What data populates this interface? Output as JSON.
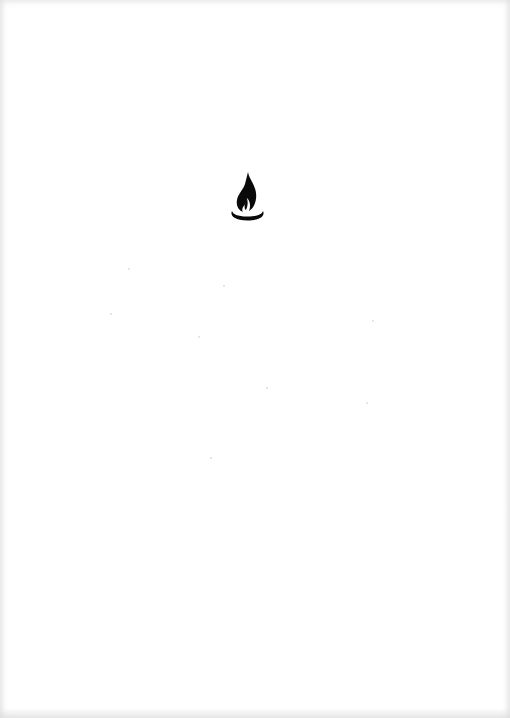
{
  "page": {
    "background_color": "#ffffff",
    "ornament": {
      "icon": "flame-icon",
      "color": "#0a0a0a",
      "position": {
        "x": 229,
        "y": 171,
        "width": 37,
        "height": 52
      }
    }
  }
}
